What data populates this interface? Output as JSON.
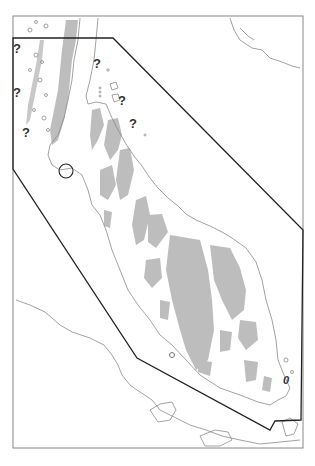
{
  "map": {
    "title": "",
    "colors": {
      "background": "#ffffff",
      "frame": "#888888",
      "coastline": "#8a8a8a",
      "highland": "#bdbdbd",
      "boundary_polygon": "#222222",
      "marker": "#222222"
    },
    "frame": {
      "x": 13,
      "y": 16,
      "width": 290,
      "height": 432
    },
    "boundary_polygon": [
      [
        13,
        38
      ],
      [
        113,
        38
      ],
      [
        303,
        230
      ],
      [
        301,
        420
      ],
      [
        275,
        421
      ],
      [
        270,
        430
      ],
      [
        137,
        358
      ],
      [
        13,
        169
      ]
    ],
    "circle_marker": {
      "cx": 66,
      "cy": 171,
      "r": 7
    },
    "question_marks": [
      {
        "x": 13,
        "y": 42,
        "label": "?"
      },
      {
        "x": 93,
        "y": 57,
        "label": "?"
      },
      {
        "x": 13,
        "y": 86,
        "label": "?"
      },
      {
        "x": 118,
        "y": 94,
        "label": "?"
      },
      {
        "x": 129,
        "y": 117,
        "label": "?"
      },
      {
        "x": 22,
        "y": 126,
        "label": "?"
      }
    ],
    "island_label": {
      "x": 283,
      "y": 375,
      "label": "0"
    }
  }
}
